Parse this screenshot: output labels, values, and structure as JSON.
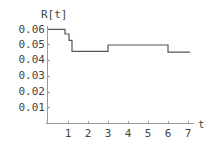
{
  "chart_data": {
    "type": "line",
    "subtype": "step",
    "title": "",
    "xlabel": "t",
    "ylabel": "R[t]",
    "xlim": [
      0,
      7.2
    ],
    "ylim": [
      0,
      0.06
    ],
    "x_ticks": [
      "1",
      "2",
      "3",
      "4",
      "5",
      "6",
      "7"
    ],
    "y_ticks": [
      "0.01",
      "0.02",
      "0.03",
      "0.04",
      "0.05",
      "0.06"
    ],
    "grid": false,
    "legend": null,
    "series": [
      {
        "name": "R[t]",
        "x": [
          0,
          0.85,
          0.85,
          1.05,
          1.05,
          1.2,
          1.2,
          3.0,
          3.0,
          6.0,
          6.0,
          7.1
        ],
        "y": [
          0.06,
          0.06,
          0.057,
          0.057,
          0.053,
          0.053,
          0.046,
          0.046,
          0.05,
          0.05,
          0.0455,
          0.0455
        ]
      }
    ]
  },
  "labels": {
    "ylabel": "R[t]",
    "xlabel": "t",
    "x_ticks": [
      "1",
      "2",
      "3",
      "4",
      "5",
      "6",
      "7"
    ],
    "y_ticks": [
      "0.01",
      "0.02",
      "0.03",
      "0.04",
      "0.05",
      "0.06"
    ]
  },
  "colors": {
    "axis": "#999999",
    "line": "#555555",
    "text": "#444444"
  }
}
